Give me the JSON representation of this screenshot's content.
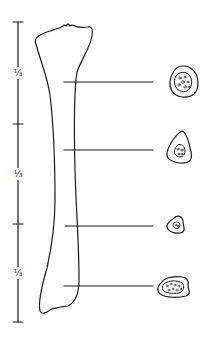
{
  "figure": {
    "ink_color": "#1a1a1a",
    "scale_bar": {
      "segments": [
        {
          "label": "⅓"
        },
        {
          "label": "⅓"
        },
        {
          "label": "⅓"
        }
      ]
    },
    "cross_sections": [
      {
        "level": 1
      },
      {
        "level": 2
      },
      {
        "level": 3
      },
      {
        "level": 4
      }
    ]
  }
}
